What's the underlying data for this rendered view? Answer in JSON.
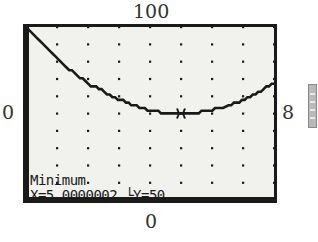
{
  "window": {
    "ymax_label": "100",
    "ymin_label": "0",
    "xmin_label": "0",
    "xmax_label": "8"
  },
  "screen": {
    "title": "Minimum",
    "readout": "X=5.0000002 └Y=50",
    "colors": {
      "background": "#f1f1ee",
      "ink": "#1a1a1a"
    }
  },
  "side_tab_icon": "scroll-tab-icon",
  "chart_data": {
    "type": "line",
    "title": "Minimum",
    "xlabel": "",
    "ylabel": "",
    "xlim": [
      0,
      8
    ],
    "ylim": [
      0,
      100
    ],
    "grid": "dots",
    "series": [
      {
        "name": "y = 2(x-5)^2 + 50",
        "x": [
          0,
          1,
          2,
          3,
          4,
          5,
          6,
          7,
          8
        ],
        "y": [
          100,
          82,
          68,
          58,
          52,
          50,
          52,
          58,
          68
        ]
      }
    ],
    "annotations": [
      {
        "type": "cursor",
        "x": 5.0000002,
        "y": 50,
        "text": "Minimum"
      }
    ]
  }
}
